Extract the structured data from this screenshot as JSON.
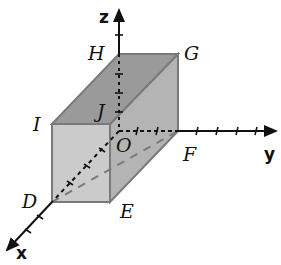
{
  "diagram": {
    "type": "3d-coordinate-box",
    "axes": {
      "x": {
        "label": "x"
      },
      "y": {
        "label": "y"
      },
      "z": {
        "label": "z"
      }
    },
    "vertices": {
      "origin": "O",
      "H": "H",
      "G": "G",
      "I": "I",
      "J": "J",
      "F": "F",
      "D": "D",
      "E": "E"
    },
    "colors": {
      "top_face": "#9a9a9a",
      "side_face": "#b4b4b4",
      "front_face": "#cbcbcb",
      "edge": "#7a7a7a",
      "axis": "#111111"
    }
  }
}
